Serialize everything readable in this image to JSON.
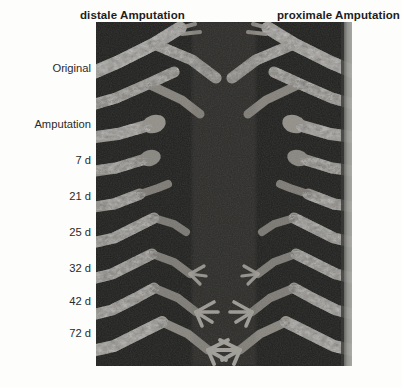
{
  "figure": {
    "title_distal": "distale Amputation",
    "title_proximal": "proximale Amputation",
    "row_labels": [
      {
        "key": "original",
        "text": "Original",
        "top": 62
      },
      {
        "key": "amputation",
        "text": "Amputation",
        "top": 118
      },
      {
        "key": "d7",
        "text": "7 d",
        "top": 154
      },
      {
        "key": "d21",
        "text": "21 d",
        "top": 190
      },
      {
        "key": "d25",
        "text": "25 d",
        "top": 226
      },
      {
        "key": "d32",
        "text": "32 d",
        "top": 262
      },
      {
        "key": "d42",
        "text": "42 d",
        "top": 295
      },
      {
        "key": "d72",
        "text": "72 d",
        "top": 327
      }
    ],
    "panel": {
      "kind": "radiograph",
      "background_color": "#1e1e1d",
      "tissue_color": "#b9b6ae",
      "edge_strip_color": "#a5a5a0",
      "caption_alt": "Grayscale radiograph montage of amputated and regenerating limbs, distal series at left and proximal series at right"
    }
  }
}
